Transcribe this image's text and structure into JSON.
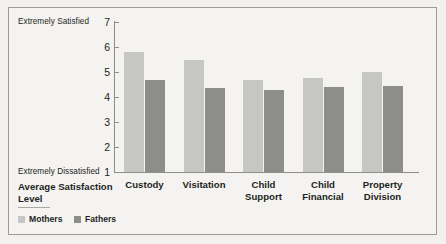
{
  "chart_data": {
    "type": "bar",
    "title": "",
    "xlabel": "Average Satisfaction Level",
    "ylabel": "",
    "ylim": [
      1,
      7
    ],
    "yticks": [
      1,
      2,
      3,
      4,
      5,
      6,
      7
    ],
    "ytick_labels": [
      "1",
      "2",
      "3",
      "4",
      "5",
      "6",
      "7"
    ],
    "grid": false,
    "legend_position": "bottom-left",
    "axis_top_annotation": "Extremely Satisfied",
    "axis_bottom_annotation": "Extremely Dissatisfied",
    "categories": [
      "Custody",
      "Visitation",
      "Child Support",
      "Child Financial",
      "Property Division"
    ],
    "category_lines": [
      [
        "Custody"
      ],
      [
        "Visitation"
      ],
      [
        "Child",
        "Support"
      ],
      [
        "Child",
        "Financial"
      ],
      [
        "Property",
        "Division"
      ]
    ],
    "series": [
      {
        "name": "Mothers",
        "color": "#c6c6c4",
        "values": [
          5.8,
          5.5,
          4.7,
          4.75,
          5.0
        ]
      },
      {
        "name": "Fathers",
        "color": "#8d8d8a",
        "values": [
          4.7,
          4.35,
          4.3,
          4.4,
          4.45
        ]
      }
    ]
  },
  "legend": {
    "mothers_label": "Mothers",
    "fathers_label": "Fathers"
  },
  "colors": {
    "mothers": "#c6c6c4",
    "fathers": "#8d8d8a",
    "background": "#f4f3f1",
    "axis": "#8e8e8a",
    "text": "#231f20"
  }
}
